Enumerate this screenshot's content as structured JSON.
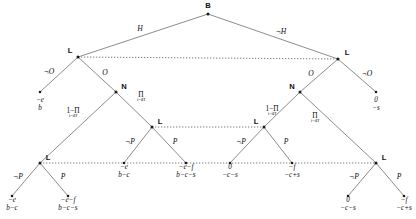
{
  "figure": {
    "width": 416,
    "height": 219,
    "line_color": "#6f6f6f",
    "info_set_color": "#7a7a7a",
    "text_color": "#0d0d0d"
  },
  "nodes": [
    {
      "id": "root",
      "label": "B",
      "x": 208,
      "y": 14,
      "label_dx": 0,
      "label_dy": -8
    },
    {
      "id": "L1",
      "label": "L",
      "x": 78,
      "y": 57,
      "label_dx": -8,
      "label_dy": -6
    },
    {
      "id": "L2",
      "label": "L",
      "x": 338,
      "y": 59,
      "label_dx": 9,
      "label_dy": -6
    },
    {
      "id": "N1",
      "label": "N",
      "x": 116,
      "y": 92,
      "label_dx": 8,
      "label_dy": -5
    },
    {
      "id": "N2",
      "label": "N",
      "x": 300,
      "y": 92,
      "label_dx": -8,
      "label_dy": -5
    },
    {
      "id": "L3",
      "label": "L",
      "x": 152,
      "y": 127,
      "label_dx": 8,
      "label_dy": -5
    },
    {
      "id": "L4",
      "label": "L",
      "x": 264,
      "y": 127,
      "label_dx": -8,
      "label_dy": -5
    },
    {
      "id": "L5",
      "label": "L",
      "x": 40,
      "y": 163,
      "label_dx": 8,
      "label_dy": -5
    },
    {
      "id": "L6",
      "label": "L",
      "x": 376,
      "y": 163,
      "label_dx": 8,
      "label_dy": -5
    }
  ],
  "terminal_nodes": [
    {
      "id": "t1",
      "x": 40,
      "y": 92
    },
    {
      "id": "t2",
      "x": 376,
      "y": 92
    },
    {
      "id": "t3",
      "x": 124,
      "y": 163
    },
    {
      "id": "t4",
      "x": 186,
      "y": 163
    },
    {
      "id": "t5",
      "x": 230,
      "y": 163
    },
    {
      "id": "t6",
      "x": 292,
      "y": 163
    },
    {
      "id": "t7",
      "x": 348,
      "y": 196
    },
    {
      "id": "t8",
      "x": 404,
      "y": 196
    },
    {
      "id": "t9",
      "x": 12,
      "y": 196
    },
    {
      "id": "t10",
      "x": 68,
      "y": 196
    }
  ],
  "edges": [
    {
      "id": "e-root-L1",
      "from": "root",
      "to": "L1",
      "label": "H",
      "label_x": 140,
      "label_y": 29
    },
    {
      "id": "e-root-L2",
      "from": "root",
      "to": "L2",
      "label": "¬H",
      "label_x": 281,
      "label_y": 32
    },
    {
      "id": "e-L1-t1",
      "from": "L1",
      "to": "t1",
      "label": "¬O",
      "label_x": 49,
      "label_y": 72
    },
    {
      "id": "e-L1-N1",
      "from": "L1",
      "to": "N1",
      "label": "O",
      "label_x": 105,
      "label_y": 73
    },
    {
      "id": "e-L2-t2",
      "from": "L2",
      "to": "t2",
      "label": "¬O",
      "label_x": 367,
      "label_y": 74
    },
    {
      "id": "e-L2-N2",
      "from": "L2",
      "to": "N2",
      "label": "O",
      "label_x": 311,
      "label_y": 74
    },
    {
      "id": "e-N1-L5",
      "from": "N1",
      "to": "L5",
      "label": "",
      "label_x": 0,
      "label_y": 0
    },
    {
      "id": "e-N1-L3",
      "from": "N1",
      "to": "L3",
      "label": "",
      "label_x": 0,
      "label_y": 0
    },
    {
      "id": "e-N2-L4",
      "from": "N2",
      "to": "L4",
      "label": "",
      "label_x": 0,
      "label_y": 0
    },
    {
      "id": "e-N2-L6",
      "from": "N2",
      "to": "L6",
      "label": "",
      "label_x": 0,
      "label_y": 0
    },
    {
      "id": "e-L3-t3",
      "from": "L3",
      "to": "t3",
      "label": "¬P",
      "label_x": 130,
      "label_y": 142
    },
    {
      "id": "e-L3-t4",
      "from": "L3",
      "to": "t4",
      "label": "P",
      "label_x": 175,
      "label_y": 142
    },
    {
      "id": "e-L4-t5",
      "from": "L4",
      "to": "t5",
      "label": "¬P",
      "label_x": 241,
      "label_y": 142
    },
    {
      "id": "e-L4-t6",
      "from": "L4",
      "to": "t6",
      "label": "P",
      "label_x": 286,
      "label_y": 142
    },
    {
      "id": "e-L5-t9",
      "from": "L5",
      "to": "t9",
      "label": "¬P",
      "label_x": 18,
      "label_y": 177
    },
    {
      "id": "e-L5-t10",
      "from": "L5",
      "to": "t10",
      "label": "P",
      "label_x": 63,
      "label_y": 177
    },
    {
      "id": "e-L6-t7",
      "from": "L6",
      "to": "t7",
      "label": "¬P",
      "label_x": 354,
      "label_y": 177
    },
    {
      "id": "e-L6-t8",
      "from": "L6",
      "to": "t8",
      "label": "P",
      "label_x": 399,
      "label_y": 177
    }
  ],
  "chance_labels": [
    {
      "id": "p-left-down",
      "main": "1−Π",
      "sub": "i=i_H",
      "x": 73,
      "y": 113
    },
    {
      "id": "p-left-up",
      "main": "Π",
      "sub": "i=i_H",
      "x": 141,
      "y": 97
    },
    {
      "id": "p-right-up",
      "main": "1−Π",
      "sub": "i=i_H",
      "x": 272,
      "y": 111
    },
    {
      "id": "p-right-down",
      "main": "Π",
      "sub": "i=i_H",
      "x": 315,
      "y": 118
    }
  ],
  "payoffs": [
    {
      "id": "pay-t1",
      "line1": "−e",
      "line2": "b",
      "x": 40,
      "y": 105
    },
    {
      "id": "pay-t2",
      "line1": "0",
      "line2": "−s",
      "x": 376,
      "y": 105
    },
    {
      "id": "pay-t3",
      "line1": "−e",
      "line2": "b−c",
      "x": 124,
      "y": 172
    },
    {
      "id": "pay-t4",
      "line1": "−e−f",
      "line2": "b−c−s",
      "x": 186,
      "y": 172
    },
    {
      "id": "pay-t5",
      "line1": "0",
      "line2": "−c−s",
      "x": 230,
      "y": 172
    },
    {
      "id": "pay-t6",
      "line1": "−f",
      "line2": "−c+s",
      "x": 292,
      "y": 172
    },
    {
      "id": "pay-t9",
      "line1": "−e",
      "line2": "b−c",
      "x": 12,
      "y": 205
    },
    {
      "id": "pay-t10",
      "line1": "−e−f",
      "line2": "b−c−s",
      "x": 68,
      "y": 205
    },
    {
      "id": "pay-t7",
      "line1": "0",
      "line2": "−c−s",
      "x": 348,
      "y": 205
    },
    {
      "id": "pay-t8",
      "line1": "−f",
      "line2": "−c+s",
      "x": 404,
      "y": 205
    }
  ],
  "information_sets": [
    {
      "id": "iset-top",
      "x1": 78,
      "y1": 57,
      "x2": 338,
      "y2": 59
    },
    {
      "id": "iset-middle",
      "x1": 152,
      "y1": 127,
      "x2": 264,
      "y2": 127
    },
    {
      "id": "iset-lower",
      "x1": 40,
      "y1": 163,
      "x2": 376,
      "y2": 163
    }
  ]
}
